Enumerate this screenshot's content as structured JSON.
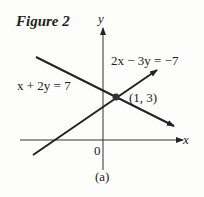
{
  "figure": {
    "title": "Figure 2",
    "caption": "(a)",
    "axes": {
      "x_label": "x",
      "y_label": "y",
      "origin_label": "0"
    },
    "lines": [
      {
        "equation": "2x − 3y = −7"
      },
      {
        "equation": "x + 2y = 7"
      }
    ],
    "intersection": {
      "label": "(1, 3)"
    }
  }
}
